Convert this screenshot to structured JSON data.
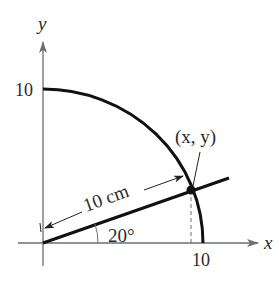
{
  "figure": {
    "axes": {
      "x_label": "x",
      "y_label": "y",
      "x_tick": "10",
      "y_tick": "10"
    },
    "point_label": "(x, y)",
    "length_label": "10 cm",
    "angle_label": "20°",
    "colors": {
      "axis": "#6e6e6e",
      "curve": "#111111",
      "text": "#2a2a2a"
    }
  }
}
